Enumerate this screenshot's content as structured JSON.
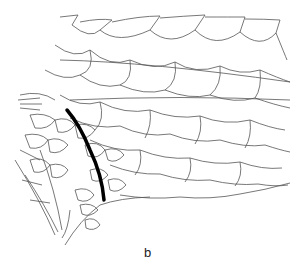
{
  "figure": {
    "panel_label": "b",
    "colors": {
      "line": "#444444",
      "stroke_dark": "#000000",
      "background": "#ffffff"
    }
  }
}
